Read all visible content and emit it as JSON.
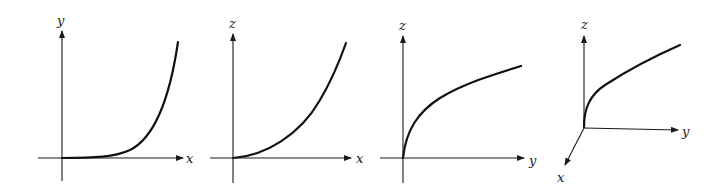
{
  "figure": {
    "panels": [
      {
        "id": "panel-1",
        "description": "Exponential-like curve in xy-plane",
        "horizontal_axis_label": "x",
        "vertical_axis_label": "y",
        "curve_shape": "exponential growth, flat near origin then rising steeply"
      },
      {
        "id": "panel-2",
        "description": "Parabola-like curve in xz-plane",
        "horizontal_axis_label": "x",
        "vertical_axis_label": "z",
        "curve_shape": "quadratic growth from origin"
      },
      {
        "id": "panel-3",
        "description": "Square-root-like curve in yz-plane",
        "horizontal_axis_label": "y",
        "vertical_axis_label": "z",
        "curve_shape": "square-root growth, steep at origin then flattening"
      },
      {
        "id": "panel-4",
        "description": "3D axes with curve in yz-plane",
        "axis_labels": {
          "x": "x",
          "y": "y",
          "z": "z"
        },
        "curve_shape": "square-root growth in yz-plane"
      }
    ],
    "colors": {
      "ink": "#111111",
      "background": "#ffffff"
    }
  }
}
